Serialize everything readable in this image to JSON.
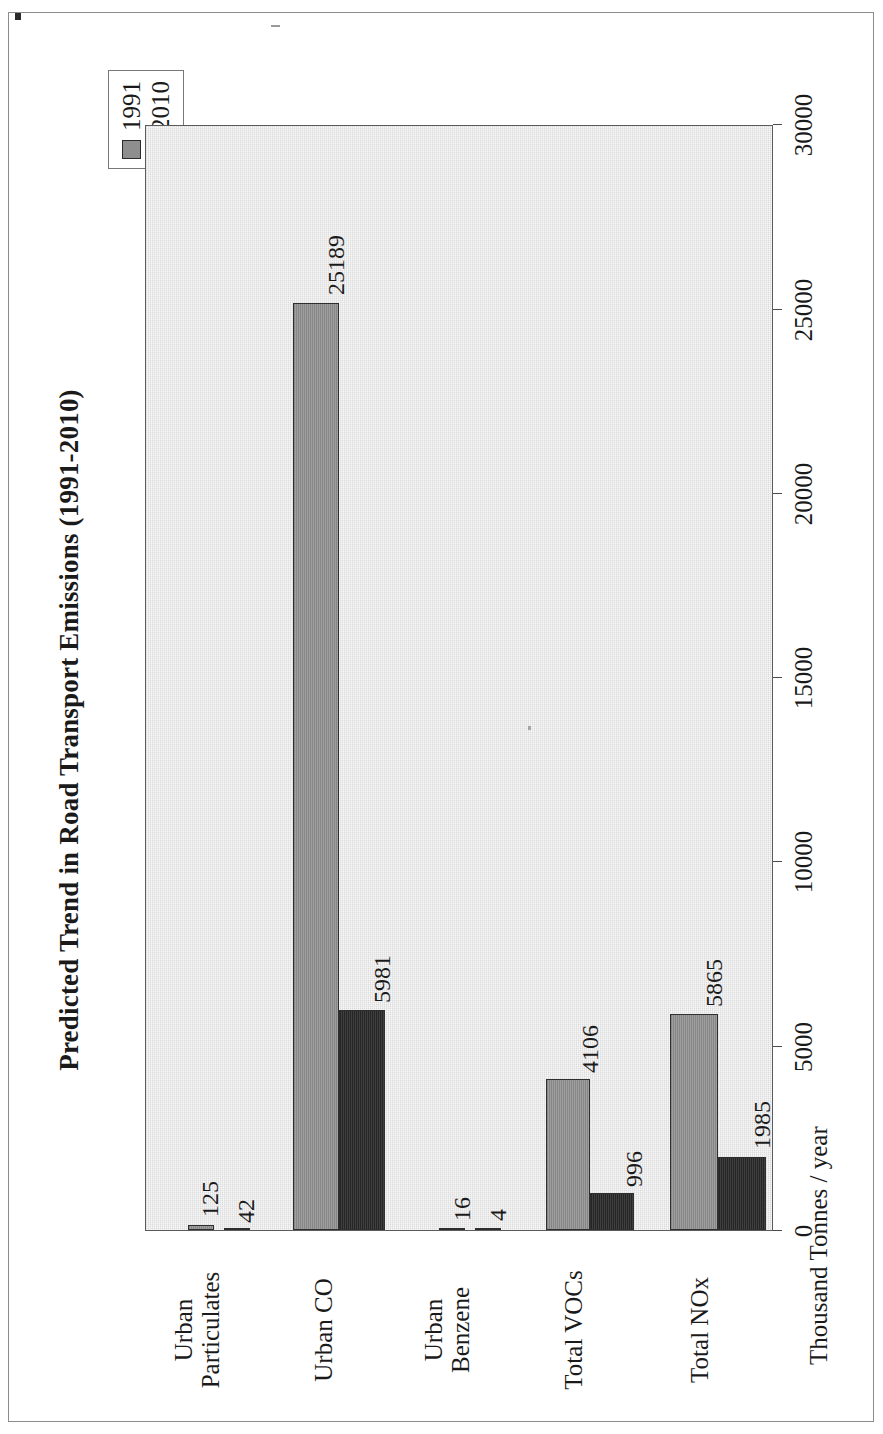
{
  "figure": {
    "title": "Predicted Trend in Road Transport Emissions (1991-2010)",
    "value_axis_title": "Thousand Tonnes / year"
  },
  "legend": {
    "items": [
      {
        "label": "1991",
        "color": "#8e8e8e",
        "swatch": "legend-swatch-1991"
      },
      {
        "label": "2010",
        "color": "#2a2a2a",
        "swatch": "legend-swatch-2010"
      }
    ]
  },
  "categories": [
    {
      "line1": "Urban",
      "line2": "Particulates"
    },
    {
      "line1": "Urban CO",
      "line2": ""
    },
    {
      "line1": "Urban",
      "line2": "Benzene"
    },
    {
      "line1": "Total VOCs",
      "line2": ""
    },
    {
      "line1": "Total NOx",
      "line2": ""
    }
  ],
  "value_ticks": [
    {
      "label": "30000",
      "value": 30000
    },
    {
      "label": "25000",
      "value": 25000
    },
    {
      "label": "20000",
      "value": 20000
    },
    {
      "label": "15000",
      "value": 15000
    },
    {
      "label": "10000",
      "value": 10000
    },
    {
      "label": "5000",
      "value": 5000
    },
    {
      "label": "0",
      "value": 0
    }
  ],
  "bar_labels": {
    "particulates_1991": "125",
    "particulates_2010": "42",
    "co_1991": "25189",
    "co_2010": "5981",
    "benzene_1991": "16",
    "benzene_2010": "4",
    "vocs_1991": "4106",
    "vocs_2010": "996",
    "nox_1991": "5865",
    "nox_2010": "1985"
  },
  "chart_data": {
    "type": "bar",
    "title": "Predicted Trend in Road Transport Emissions (1991-2010)",
    "orientation": "vertical",
    "categories": [
      "Urban Particulates",
      "Urban CO",
      "Urban Benzene",
      "Total VOCs",
      "Total NOx"
    ],
    "series": [
      {
        "name": "1991",
        "color": "#8e8e8e",
        "values": [
          125,
          25189,
          16,
          4106,
          5865
        ]
      },
      {
        "name": "2010",
        "color": "#2a2a2a",
        "values": [
          42,
          5981,
          4,
          996,
          1985
        ]
      }
    ],
    "xlabel": "",
    "ylabel": "Thousand Tonnes / year",
    "ylim": [
      0,
      30000
    ],
    "ytick_values": [
      0,
      5000,
      10000,
      15000,
      20000,
      25000,
      30000
    ],
    "ytick_labels": [
      "0",
      "5000",
      "10000",
      "15000",
      "20000",
      "25000",
      "30000"
    ],
    "grid": false,
    "legend_position": "top-right",
    "data_labels": true,
    "plot_background": "#dcdcdc"
  }
}
